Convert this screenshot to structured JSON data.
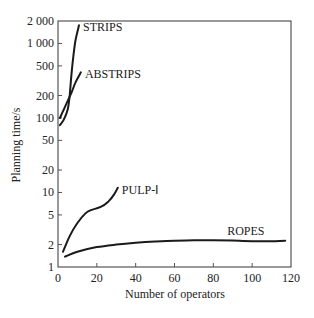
{
  "chart_data": {
    "type": "line",
    "title": "",
    "xlabel": "Number of operators",
    "ylabel": "Planning time/s",
    "xlim": [
      0,
      120
    ],
    "ylim": [
      1,
      2000
    ],
    "yscale": "log",
    "grid": false,
    "legend": "inline-labels",
    "x_ticks": [
      0,
      20,
      40,
      60,
      80,
      100,
      120
    ],
    "x_tick_labels": [
      "0",
      "20",
      "40",
      "60",
      "80",
      "100",
      "120"
    ],
    "y_ticks": [
      1,
      2,
      5,
      10,
      20,
      50,
      100,
      200,
      500,
      1000,
      2000
    ],
    "y_tick_labels": [
      "1",
      "2",
      "5",
      "10",
      "20",
      "50",
      "100",
      "200",
      "500",
      "1 000",
      "2 000"
    ],
    "series": [
      {
        "name": "STRIPS",
        "label": "STRIPS",
        "points": [
          [
            1,
            80
          ],
          [
            3,
            95
          ],
          [
            5,
            130
          ],
          [
            6,
            200
          ],
          [
            7,
            400
          ],
          [
            8,
            700
          ],
          [
            9,
            1100
          ],
          [
            10.8,
            1750
          ]
        ]
      },
      {
        "name": "ABSTRIPS",
        "label": "ABSTRIPS",
        "points": [
          [
            1,
            100
          ],
          [
            3,
            130
          ],
          [
            5,
            170
          ],
          [
            7,
            220
          ],
          [
            9,
            300
          ],
          [
            11.8,
            410
          ]
        ]
      },
      {
        "name": "PULP-I",
        "label": "PULP-Ⅰ",
        "points": [
          [
            2.6,
            1.6
          ],
          [
            6,
            2.6
          ],
          [
            10,
            3.9
          ],
          [
            14,
            5.2
          ],
          [
            17,
            5.8
          ],
          [
            22,
            6.4
          ],
          [
            26,
            7.6
          ],
          [
            29,
            9.5
          ],
          [
            30.8,
            11.6
          ]
        ]
      },
      {
        "name": "ROPES",
        "label": "ROPES",
        "points": [
          [
            3.6,
            1.38
          ],
          [
            10,
            1.6
          ],
          [
            20,
            1.85
          ],
          [
            30,
            2.0
          ],
          [
            40,
            2.12
          ],
          [
            50,
            2.2
          ],
          [
            60,
            2.25
          ],
          [
            70,
            2.28
          ],
          [
            80,
            2.28
          ],
          [
            90,
            2.26
          ],
          [
            100,
            2.22
          ],
          [
            110,
            2.22
          ],
          [
            117,
            2.25
          ]
        ]
      }
    ]
  }
}
